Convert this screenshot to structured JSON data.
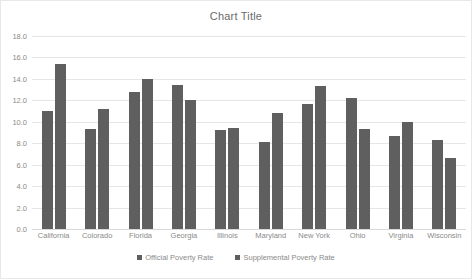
{
  "chart_data": {
    "type": "bar",
    "title": "Chart Title",
    "xlabel": "",
    "ylabel": "",
    "ylim": [
      0.0,
      18.0
    ],
    "ytick_step": 2.0,
    "ytick_labels": [
      "18.0",
      "16.0",
      "14.0",
      "12.0",
      "10.0",
      "8.0",
      "6.0",
      "4.0",
      "2.0",
      "0.0"
    ],
    "ytick_values": [
      18.0,
      16.0,
      14.0,
      12.0,
      10.0,
      8.0,
      6.0,
      4.0,
      2.0,
      0.0
    ],
    "grid": true,
    "legend_position": "bottom",
    "bar_color": "#5f5f5f",
    "categories": [
      "California",
      "Colorado",
      "Florida",
      "Georgia",
      "Illinois",
      "Maryland",
      "New York",
      "Ohio",
      "Virginia",
      "Wisconsin"
    ],
    "series": [
      {
        "name": "Official Poverty Rate",
        "color": "#5f5f5f",
        "values": [
          11.0,
          9.3,
          12.8,
          13.4,
          9.2,
          8.1,
          11.7,
          12.2,
          8.7,
          8.3
        ]
      },
      {
        "name": "Supplemental Poverty Rate",
        "color": "#5f5f5f",
        "values": [
          15.4,
          11.2,
          14.0,
          12.0,
          9.4,
          10.8,
          13.3,
          9.3,
          10.0,
          6.6
        ]
      }
    ]
  }
}
